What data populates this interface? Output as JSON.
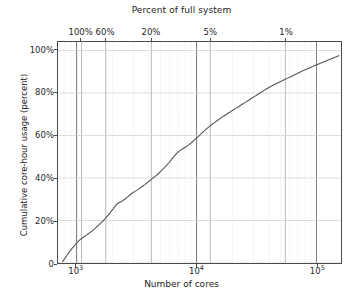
{
  "chart_data": {
    "type": "line",
    "title": "Percent of full system",
    "xlabel": "Number of cores",
    "ylabel": "Cumulative core-hour usage (percent)",
    "xscale": "log",
    "xlim": [
      700,
      160000
    ],
    "ylim": [
      0,
      104
    ],
    "grid": true,
    "legend": "none",
    "x_ticks_bottom": [
      {
        "value": 1000,
        "label_base": "10",
        "label_exp": "3"
      },
      {
        "value": 10000,
        "label_base": "10",
        "label_exp": "4"
      },
      {
        "value": 100000,
        "label_base": "10",
        "label_exp": "5"
      }
    ],
    "x_ticks_top": [
      {
        "value": 1100,
        "label": "100%"
      },
      {
        "value": 1750,
        "label": "60%"
      },
      {
        "value": 4200,
        "label": "20%"
      },
      {
        "value": 13000,
        "label": "5%"
      },
      {
        "value": 55000,
        "label": "1%"
      }
    ],
    "y_ticks": [
      {
        "value": 0,
        "label": "0"
      },
      {
        "value": 20,
        "label": "20%"
      },
      {
        "value": 40,
        "label": "40%"
      },
      {
        "value": 60,
        "label": "60%"
      },
      {
        "value": 80,
        "label": "80%"
      },
      {
        "value": 100,
        "label": "100%"
      }
    ],
    "series": [
      {
        "name": "Cumulative core-hour usage",
        "color": "#555555",
        "x": [
          760,
          800,
          840,
          880,
          920,
          960,
          1000,
          1040,
          1090,
          1140,
          1200,
          1270,
          1340,
          1420,
          1500,
          1580,
          1660,
          1740,
          1820,
          1900,
          2000,
          2100,
          2200,
          2300,
          2400,
          2520,
          2650,
          2780,
          2900,
          3050,
          3200,
          3350,
          3500,
          3700,
          3900,
          4100,
          4300,
          4550,
          4800,
          5050,
          5300,
          5600,
          5900,
          6200,
          6500,
          6900,
          7300,
          7700,
          8100,
          8600,
          9100,
          9600,
          10200,
          10800,
          11400,
          12100,
          12800,
          13500,
          14300,
          15200,
          16100,
          17000,
          18000,
          19100,
          20200,
          21400,
          22700,
          24000,
          25500,
          27000,
          28600,
          30300,
          32100,
          34000,
          36000,
          38200,
          40500,
          43000,
          45500,
          48300,
          51200,
          54300,
          57500,
          61000,
          64600,
          68500,
          72600,
          77000,
          81600,
          86500,
          91700,
          97200,
          103000,
          109200,
          115800,
          122700,
          130100,
          137900,
          146200,
          155000
        ],
        "y": [
          0.5,
          2.2,
          4.0,
          5.6,
          7.0,
          8.2,
          9.4,
          10.4,
          11.3,
          12.1,
          13.0,
          14.0,
          15.0,
          16.2,
          17.4,
          18.6,
          19.8,
          21.0,
          22.3,
          23.6,
          25.2,
          26.9,
          28.0,
          28.6,
          29.2,
          30.0,
          31.0,
          32.0,
          32.8,
          33.6,
          34.3,
          35.1,
          35.9,
          36.9,
          37.9,
          38.9,
          39.8,
          40.9,
          42.0,
          43.2,
          44.4,
          45.8,
          47.3,
          48.8,
          50.2,
          51.8,
          53.0,
          53.8,
          54.6,
          55.6,
          56.7,
          57.9,
          59.2,
          60.5,
          61.8,
          63.1,
          64.3,
          65.3,
          66.3,
          67.4,
          68.4,
          69.3,
          70.2,
          71.1,
          72.0,
          72.9,
          73.8,
          74.7,
          75.6,
          76.5,
          77.4,
          78.3,
          79.2,
          80.1,
          81.0,
          81.9,
          82.7,
          83.5,
          84.2,
          84.9,
          85.6,
          86.3,
          87.0,
          87.7,
          88.4,
          89.1,
          89.8,
          90.5,
          91.1,
          91.7,
          92.3,
          92.9,
          93.5,
          94.1,
          94.7,
          95.3,
          95.9,
          96.5,
          97.1,
          97.7
        ]
      }
    ]
  },
  "axes": {
    "top_title": "Percent of full system",
    "bottom_title": "Number of cores",
    "y_title": "Cumulative core-hour usage (percent)"
  }
}
